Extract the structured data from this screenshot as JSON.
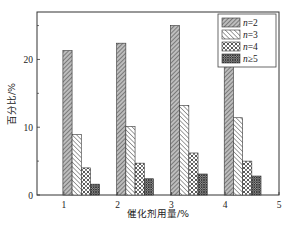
{
  "chart_data": {
    "type": "bar",
    "title": "",
    "xlabel": "催化剂用量/%",
    "ylabel": "百分比/%",
    "categories": [
      "1",
      "2",
      "3",
      "4"
    ],
    "x_ticks": [
      "1",
      "2",
      "3",
      "4",
      "5"
    ],
    "y_ticks": [
      "0",
      "10",
      "20"
    ],
    "y_minor_ticks": [
      5,
      15,
      25
    ],
    "xlim": [
      0.5,
      5
    ],
    "ylim": [
      0,
      27
    ],
    "grid": false,
    "legend_position": "upper right",
    "series": [
      {
        "name": "n=2",
        "pattern": "dense-diagonal-hatch",
        "values": [
          21.3,
          22.4,
          25.0,
          24.1
        ]
      },
      {
        "name": "n=3",
        "pattern": "backslash-hatch",
        "values": [
          8.9,
          10.1,
          13.2,
          11.4
        ]
      },
      {
        "name": "n=4",
        "pattern": "cross-hatch",
        "values": [
          4.0,
          4.7,
          6.2,
          5.0
        ]
      },
      {
        "name": "n≥5",
        "pattern": "dense-cross-hatch",
        "values": [
          1.6,
          2.4,
          3.1,
          2.8
        ]
      }
    ]
  },
  "legend": {
    "items": [
      {
        "prefix": "n",
        "suffix": "=2"
      },
      {
        "prefix": "n",
        "suffix": "=3"
      },
      {
        "prefix": "n",
        "suffix": "=4"
      },
      {
        "prefix": "n",
        "suffix": "≥5"
      }
    ]
  },
  "axes": {
    "x_title": "催化剂用量/%",
    "y_title": "百分比/%",
    "x_tick_labels": [
      "1",
      "2",
      "3",
      "4",
      "5"
    ],
    "y_tick_labels": [
      "0",
      "10",
      "20"
    ]
  }
}
